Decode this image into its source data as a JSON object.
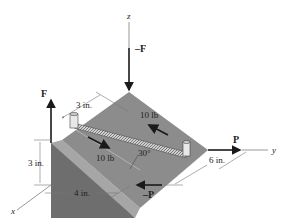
{
  "figure": {
    "axes": {
      "x": "x",
      "y": "y",
      "z": "z"
    },
    "forces": {
      "top_force": "–F",
      "left_force": "F",
      "right_force": "P",
      "bottom_force": "–P"
    },
    "spring_forces": {
      "upper": "10 lb",
      "lower": "10 lb"
    },
    "angle": "30°",
    "dimensions": {
      "post_offset": "3 in.",
      "height": "3 in.",
      "width": "4 in.",
      "depth": "6 in."
    },
    "colors": {
      "top_surface": "#8c8c8c",
      "front_face": "#6e6e6e",
      "slope_face": "#a6a6a6",
      "arrow": "#1a1a1a",
      "dim_line": "#777777"
    }
  }
}
